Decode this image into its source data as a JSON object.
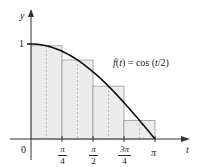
{
  "chart_data": {
    "type": "bar",
    "title": "",
    "function_label": "f(t) = cos (t/2)",
    "xlabel": "t",
    "ylabel": "y",
    "x_ticks": [
      {
        "value": 0,
        "label": "0"
      },
      {
        "value": 0.7854,
        "label_num": "π",
        "label_den": "4"
      },
      {
        "value": 1.5708,
        "label_num": "π",
        "label_den": "2"
      },
      {
        "value": 2.3562,
        "label_num": "3π",
        "label_den": "4"
      },
      {
        "value": 3.1416,
        "label": "π"
      }
    ],
    "y_ticks": [
      {
        "value": 1,
        "label": "1"
      }
    ],
    "xlim": [
      0,
      3.1416
    ],
    "ylim": [
      0,
      1
    ],
    "curve": {
      "expr": "cos(t/2)",
      "color": "#111111"
    },
    "rectangles": {
      "method": "midpoint",
      "n": 4,
      "intervals": [
        [
          0,
          0.7854
        ],
        [
          0.7854,
          1.5708
        ],
        [
          1.5708,
          2.3562
        ],
        [
          2.3562,
          3.1416
        ]
      ],
      "midpoints": [
        0.3927,
        1.1781,
        1.9635,
        2.7489
      ],
      "heights": [
        0.981,
        0.831,
        0.556,
        0.195
      ],
      "fill": "#ececec",
      "stroke": "#9a9a9a"
    },
    "grid": false
  },
  "labels": {
    "y_axis": "y",
    "t_axis": "t",
    "origin": "0",
    "one": "1",
    "pi": "π",
    "pi_over_4_num": "π",
    "pi_over_4_den": "4",
    "pi_over_2_num": "π",
    "pi_over_2_den": "2",
    "three_pi_over_4_num": "3π",
    "three_pi_over_4_den": "4",
    "function": "f(t) = cos (t/2)"
  }
}
